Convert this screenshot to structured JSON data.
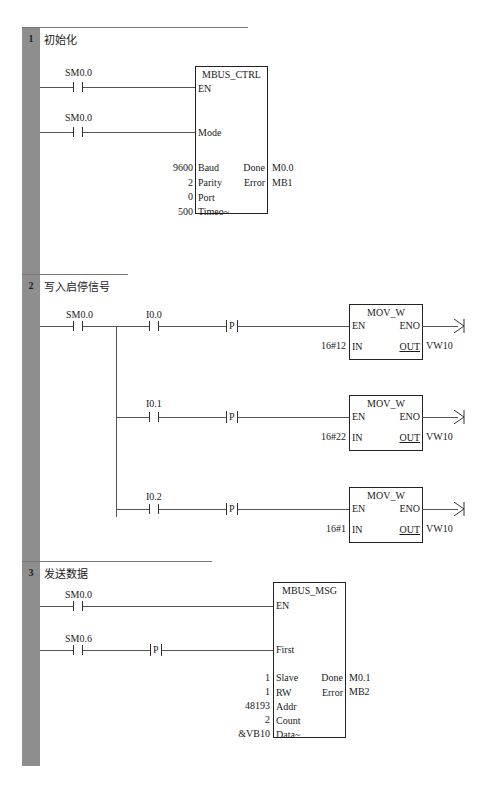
{
  "networks": [
    {
      "number": "1",
      "title": "初始化",
      "contacts": [
        {
          "label": "SM0.0"
        },
        {
          "label": "SM0.0"
        }
      ],
      "block": {
        "name": "MBUS_CTRL",
        "inputs": {
          "en": "EN",
          "mode": "Mode",
          "baud": "Baud",
          "parity": "Parity",
          "port": "Port",
          "timeout": "Timeo~"
        },
        "input_values": {
          "baud": "9600",
          "parity": "2",
          "port": "0",
          "timeout": "500"
        },
        "outputs": {
          "done": "Done",
          "error": "Error"
        },
        "output_values": {
          "done": "M0.0",
          "error": "MB1"
        }
      }
    },
    {
      "number": "2",
      "title": "写入启停信号",
      "main_contact": {
        "label": "SM0.0"
      },
      "branches": [
        {
          "contact": "I0.0",
          "trigger": "P",
          "block": "MOV_W",
          "en": "EN",
          "eno": "ENO",
          "in_label": "IN",
          "out_label": "OUT",
          "in_value": "16#12",
          "out_value": "VW10"
        },
        {
          "contact": "I0.1",
          "trigger": "P",
          "block": "MOV_W",
          "en": "EN",
          "eno": "ENO",
          "in_label": "IN",
          "out_label": "OUT",
          "in_value": "16#22",
          "out_value": "VW10"
        },
        {
          "contact": "I0.2",
          "trigger": "P",
          "block": "MOV_W",
          "en": "EN",
          "eno": "ENO",
          "in_label": "IN",
          "out_label": "OUT",
          "in_value": "16#1",
          "out_value": "VW10"
        }
      ]
    },
    {
      "number": "3",
      "title": "发送数据",
      "contacts": [
        {
          "label": "SM0.0"
        },
        {
          "label": "SM0.6",
          "trigger": "P"
        }
      ],
      "block": {
        "name": "MBUS_MSG",
        "inputs": {
          "en": "EN",
          "first": "First",
          "slave": "Slave",
          "rw": "RW",
          "addr": "Addr",
          "count": "Count",
          "data": "Data~"
        },
        "input_values": {
          "slave": "1",
          "rw": "1",
          "addr": "48193",
          "count": "2",
          "data": "&VB10"
        },
        "outputs": {
          "done": "Done",
          "error": "Error"
        },
        "output_values": {
          "done": "M0.1",
          "error": "MB2"
        }
      }
    }
  ],
  "colors": {
    "rail": "#8e8e8e",
    "wire": "#555555",
    "box_border": "#222222"
  }
}
